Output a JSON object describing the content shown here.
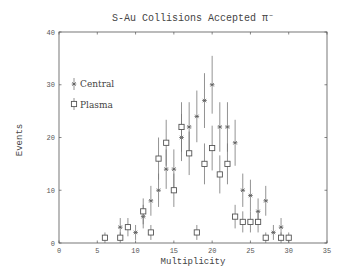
{
  "chart_data": {
    "type": "scatter",
    "title": "S-Au Collisions Accepted π⁻",
    "xlabel": "Multiplicity",
    "ylabel": "Events",
    "xlim": [
      0,
      35
    ],
    "ylim": [
      0,
      40
    ],
    "xticks": [
      0,
      5,
      10,
      15,
      20,
      25,
      30,
      35
    ],
    "yticks": [
      0,
      10,
      20,
      30,
      40
    ],
    "grid": false,
    "legend_position": "upper-left",
    "error_bars": "sqrt(N)",
    "series": [
      {
        "name": "Central",
        "marker": "asterisk",
        "x": [
          8,
          10,
          11,
          12,
          13,
          14,
          15,
          16,
          17,
          18,
          19,
          20,
          21,
          22,
          23,
          24,
          25,
          26,
          27,
          28,
          29
        ],
        "y": [
          3,
          2,
          5,
          8,
          10,
          14,
          14,
          20,
          22,
          24,
          27,
          30,
          22,
          22,
          19,
          10,
          9,
          6,
          8,
          2,
          3
        ]
      },
      {
        "name": "Plasma",
        "marker": "open-square",
        "x": [
          6,
          8,
          9,
          11,
          12,
          13,
          14,
          15,
          16,
          17,
          18,
          19,
          20,
          21,
          22,
          23,
          24,
          25,
          26,
          27,
          29,
          30
        ],
        "y": [
          1,
          1,
          3,
          6,
          2,
          16,
          19,
          10,
          22,
          17,
          2,
          15,
          18,
          13,
          15,
          5,
          4,
          4,
          4,
          1,
          1,
          1
        ]
      }
    ]
  },
  "plot": {
    "title": "S-Au Collisions Accepted π⁻",
    "xlabel": "Multiplicity",
    "ylabel": "Events",
    "legend": [
      "Central",
      "Plasma"
    ]
  }
}
